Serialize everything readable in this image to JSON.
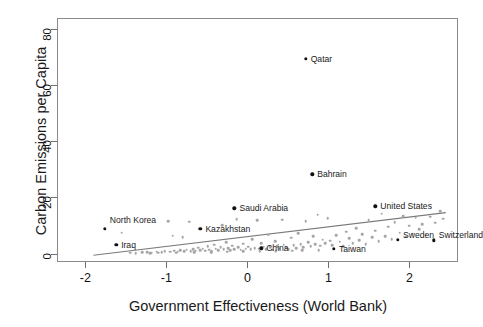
{
  "chart_data": {
    "type": "scatter",
    "title": "",
    "xlabel": "Government Effectiveness (World Bank)",
    "ylabel": "Carbon Emissions per Capita",
    "xlim": [
      -2.35,
      2.6
    ],
    "ylim": [
      -3,
      84
    ],
    "grid": false,
    "legend": null,
    "xticks": [
      "-2",
      "-1",
      "0",
      "1",
      "2"
    ],
    "xtick_values": [
      -2,
      -1,
      0,
      1,
      2
    ],
    "yticks": [
      "0",
      "20",
      "40",
      "60",
      "80"
    ],
    "ytick_values": [
      0,
      20,
      40,
      60,
      80
    ],
    "point_color": "#a6a6a6",
    "highlight_color": "#111111",
    "trendline_color": "#7a7a7a",
    "trendline": {
      "x0": -1.9,
      "y0": -0.6,
      "x1": 2.45,
      "y1": 14.6
    },
    "labeled_points": [
      {
        "label": "Qatar",
        "x": 0.72,
        "y": 69.5,
        "label_dx": 5,
        "label_dy": 0
      },
      {
        "label": "Bahrain",
        "x": 0.8,
        "y": 28.2,
        "label_dx": 5,
        "label_dy": 0
      },
      {
        "label": "Saudi Arabia",
        "x": -0.16,
        "y": 16.1,
        "label_dx": 5,
        "label_dy": 0
      },
      {
        "label": "United States",
        "x": 1.58,
        "y": 16.8,
        "label_dx": 5,
        "label_dy": 0
      },
      {
        "label": "Kazakhstan",
        "x": -0.58,
        "y": 8.9,
        "label_dx": 5,
        "label_dy": 0
      },
      {
        "label": "North Korea",
        "x": -1.76,
        "y": 8.8,
        "label_dx": 5,
        "label_dy": -9
      },
      {
        "label": "Iraq",
        "x": -1.62,
        "y": 3.1,
        "label_dx": 5,
        "label_dy": 0
      },
      {
        "label": "China",
        "x": 0.17,
        "y": 1.9,
        "label_dx": 5,
        "label_dy": 0
      },
      {
        "label": "Taiwan",
        "x": 1.07,
        "y": 1.6,
        "label_dx": 5,
        "label_dy": 0
      },
      {
        "label": "Sweden",
        "x": 1.86,
        "y": 4.9,
        "label_dx": 5,
        "label_dy": -5
      },
      {
        "label": "Switzerland",
        "x": 2.3,
        "y": 4.8,
        "label_dx": 5,
        "label_dy": -5
      }
    ],
    "points": [
      {
        "x": -1.55,
        "y": 7.4
      },
      {
        "x": -1.45,
        "y": 0.3
      },
      {
        "x": -1.38,
        "y": 0.2
      },
      {
        "x": -1.3,
        "y": 0.4
      },
      {
        "x": -1.24,
        "y": 0.5
      },
      {
        "x": -1.18,
        "y": 0.3
      },
      {
        "x": -1.12,
        "y": 0.6
      },
      {
        "x": -1.06,
        "y": 0.5
      },
      {
        "x": -1.02,
        "y": 0.9
      },
      {
        "x": -0.98,
        "y": 11.5
      },
      {
        "x": -0.95,
        "y": 0.7
      },
      {
        "x": -0.92,
        "y": 6.4
      },
      {
        "x": -0.9,
        "y": 1.1
      },
      {
        "x": -0.86,
        "y": 0.6
      },
      {
        "x": -0.83,
        "y": 1.3
      },
      {
        "x": -0.8,
        "y": 5.9
      },
      {
        "x": -0.78,
        "y": 0.8
      },
      {
        "x": -0.75,
        "y": 1.4
      },
      {
        "x": -0.72,
        "y": 11.3
      },
      {
        "x": -0.7,
        "y": 0.9
      },
      {
        "x": -0.67,
        "y": 1.6
      },
      {
        "x": -0.64,
        "y": 1.0
      },
      {
        "x": -0.61,
        "y": 2.1
      },
      {
        "x": -0.58,
        "y": 1.2
      },
      {
        "x": -0.55,
        "y": 1.8
      },
      {
        "x": -0.52,
        "y": 1.1
      },
      {
        "x": -0.49,
        "y": 2.6
      },
      {
        "x": -0.47,
        "y": 1.4
      },
      {
        "x": -0.44,
        "y": 0.9
      },
      {
        "x": -0.41,
        "y": 3.2
      },
      {
        "x": -0.39,
        "y": 1.7
      },
      {
        "x": -0.36,
        "y": 1.2
      },
      {
        "x": -0.33,
        "y": 2.3
      },
      {
        "x": -0.31,
        "y": 10.2
      },
      {
        "x": -0.29,
        "y": 1.5
      },
      {
        "x": -0.26,
        "y": 4.1
      },
      {
        "x": -0.24,
        "y": 1.9
      },
      {
        "x": -0.21,
        "y": 1.3
      },
      {
        "x": -0.19,
        "y": 2.8
      },
      {
        "x": -0.16,
        "y": 1.6
      },
      {
        "x": -0.13,
        "y": 12.3
      },
      {
        "x": -0.11,
        "y": 2.2
      },
      {
        "x": -0.08,
        "y": 1.4
      },
      {
        "x": -0.05,
        "y": 3.5
      },
      {
        "x": -0.02,
        "y": 1.8
      },
      {
        "x": 0.01,
        "y": 2.4
      },
      {
        "x": 0.04,
        "y": 1.5
      },
      {
        "x": 0.06,
        "y": 5.2
      },
      {
        "x": 0.09,
        "y": 2.0
      },
      {
        "x": 0.12,
        "y": 11.9
      },
      {
        "x": 0.14,
        "y": 1.7
      },
      {
        "x": 0.17,
        "y": 3.8
      },
      {
        "x": 0.2,
        "y": 2.5
      },
      {
        "x": 0.23,
        "y": 1.6
      },
      {
        "x": 0.26,
        "y": 6.8
      },
      {
        "x": 0.28,
        "y": 2.2
      },
      {
        "x": 0.31,
        "y": 1.4
      },
      {
        "x": 0.34,
        "y": 4.4
      },
      {
        "x": 0.37,
        "y": 2.7
      },
      {
        "x": 0.4,
        "y": 1.8
      },
      {
        "x": 0.43,
        "y": 12.1
      },
      {
        "x": 0.45,
        "y": 3.1
      },
      {
        "x": 0.48,
        "y": 2.1
      },
      {
        "x": 0.51,
        "y": 1.5
      },
      {
        "x": 0.54,
        "y": 5.6
      },
      {
        "x": 0.57,
        "y": 2.9
      },
      {
        "x": 0.6,
        "y": 1.9
      },
      {
        "x": 0.63,
        "y": 7.2
      },
      {
        "x": 0.66,
        "y": 3.4
      },
      {
        "x": 0.69,
        "y": 2.3
      },
      {
        "x": 0.72,
        "y": 11.6
      },
      {
        "x": 0.75,
        "y": 4.0
      },
      {
        "x": 0.78,
        "y": 2.6
      },
      {
        "x": 0.81,
        "y": 6.1
      },
      {
        "x": 0.84,
        "y": 3.3
      },
      {
        "x": 0.87,
        "y": 13.8
      },
      {
        "x": 0.9,
        "y": 2.8
      },
      {
        "x": 0.93,
        "y": 5.0
      },
      {
        "x": 0.96,
        "y": 3.6
      },
      {
        "x": 0.99,
        "y": 12.6
      },
      {
        "x": 1.02,
        "y": 4.6
      },
      {
        "x": 1.05,
        "y": 3.0
      },
      {
        "x": 1.1,
        "y": 6.6
      },
      {
        "x": 1.14,
        "y": 4.2
      },
      {
        "x": 1.18,
        "y": 2.7
      },
      {
        "x": 1.22,
        "y": 7.8
      },
      {
        "x": 1.26,
        "y": 5.4
      },
      {
        "x": 1.3,
        "y": 3.7
      },
      {
        "x": 1.34,
        "y": 9.1
      },
      {
        "x": 1.38,
        "y": 4.8
      },
      {
        "x": 1.42,
        "y": 6.9
      },
      {
        "x": 1.46,
        "y": 3.4
      },
      {
        "x": 1.5,
        "y": 11.8
      },
      {
        "x": 1.54,
        "y": 5.8
      },
      {
        "x": 1.58,
        "y": 8.2
      },
      {
        "x": 1.62,
        "y": 4.5
      },
      {
        "x": 1.66,
        "y": 14.2
      },
      {
        "x": 1.7,
        "y": 6.3
      },
      {
        "x": 1.74,
        "y": 9.6
      },
      {
        "x": 1.78,
        "y": 5.1
      },
      {
        "x": 1.82,
        "y": 11.2
      },
      {
        "x": 1.88,
        "y": 7.5
      },
      {
        "x": 1.92,
        "y": 13.4
      },
      {
        "x": 1.96,
        "y": 6.0
      },
      {
        "x": 2.0,
        "y": 9.9
      },
      {
        "x": 2.04,
        "y": 7.1
      },
      {
        "x": 2.08,
        "y": 12.8
      },
      {
        "x": 2.12,
        "y": 8.6
      },
      {
        "x": 2.16,
        "y": 10.4
      },
      {
        "x": 2.2,
        "y": 6.7
      },
      {
        "x": 2.26,
        "y": 13.1
      },
      {
        "x": 2.32,
        "y": 11.0
      },
      {
        "x": 2.38,
        "y": 15.2
      },
      {
        "x": 2.42,
        "y": 12.4
      },
      {
        "x": -1.2,
        "y": 0.15
      },
      {
        "x": -1.1,
        "y": 0.25
      },
      {
        "x": -0.88,
        "y": 0.35
      },
      {
        "x": -0.66,
        "y": 0.45
      },
      {
        "x": -0.45,
        "y": 0.55
      },
      {
        "x": -0.25,
        "y": 0.65
      },
      {
        "x": -0.05,
        "y": 0.75
      },
      {
        "x": 0.15,
        "y": 0.85
      },
      {
        "x": 0.35,
        "y": 0.95
      },
      {
        "x": 0.55,
        "y": 1.05
      },
      {
        "x": 0.68,
        "y": 1.15
      },
      {
        "x": 0.88,
        "y": 1.25
      }
    ]
  }
}
